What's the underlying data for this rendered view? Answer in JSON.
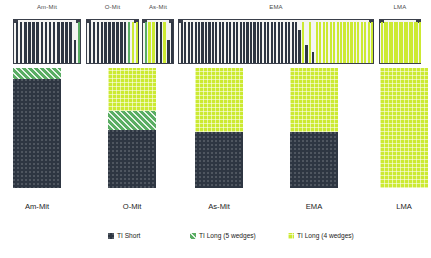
{
  "chart_data": {
    "type": "bar",
    "title": "",
    "xlabel": "",
    "ylabel": "",
    "categories": [
      "Am-Mit",
      "O-Mit",
      "As-Mit",
      "EMA",
      "LMA"
    ],
    "series": [
      {
        "name": "TI Short",
        "values": [
          93,
          55,
          45,
          45,
          0
        ]
      },
      {
        "name": "TI Long (5 wedges)",
        "values": [
          7,
          15,
          0,
          0,
          0
        ]
      },
      {
        "name": "TI Long (4 wedges)",
        "values": [
          0,
          30,
          55,
          55,
          100
        ]
      }
    ],
    "ylim": [
      0,
      100
    ],
    "grid": false,
    "legend_position": "bottom"
  },
  "top_panel": {
    "groups": [
      {
        "title": "Am-Mit",
        "bars": [
          {
            "type": "short",
            "height": 100
          },
          {
            "type": "short",
            "height": 100
          },
          {
            "type": "short",
            "height": 100
          },
          {
            "type": "short",
            "height": 100
          },
          {
            "type": "short",
            "height": 100
          },
          {
            "type": "short",
            "height": 100
          },
          {
            "type": "short",
            "height": 100
          },
          {
            "type": "short",
            "height": 100
          },
          {
            "type": "short",
            "height": 100
          },
          {
            "type": "short",
            "height": 100
          },
          {
            "type": "short",
            "height": 100
          },
          {
            "type": "short",
            "height": 100
          },
          {
            "type": "short",
            "height": 100
          },
          {
            "type": "short",
            "height": 100
          },
          {
            "type": "short",
            "height": 55
          },
          {
            "type": "long5",
            "height": 100
          }
        ]
      },
      {
        "title": "O-Mit",
        "bars": [
          {
            "type": "short",
            "height": 100
          },
          {
            "type": "short",
            "height": 100
          },
          {
            "type": "short",
            "height": 100
          },
          {
            "type": "short",
            "height": 100
          },
          {
            "type": "short",
            "height": 100
          },
          {
            "type": "short",
            "height": 100
          },
          {
            "type": "short",
            "height": 100
          },
          {
            "type": "short",
            "height": 100
          },
          {
            "type": "short",
            "height": 100
          },
          {
            "type": "short",
            "height": 100
          },
          {
            "type": "long5",
            "height": 100
          },
          {
            "type": "long4",
            "height": 100
          },
          {
            "type": "long4",
            "height": 100
          }
        ]
      },
      {
        "title": "As-Mit",
        "bars": [
          {
            "type": "long5",
            "height": 100
          },
          {
            "type": "long4",
            "height": 100
          },
          {
            "type": "long4",
            "height": 100
          },
          {
            "type": "short",
            "height": 100
          },
          {
            "type": "short",
            "height": 100
          },
          {
            "type": "long4",
            "height": 100
          },
          {
            "type": "short",
            "height": 55
          },
          {
            "type": "short",
            "height": 100
          }
        ]
      },
      {
        "title": "EMA",
        "bars": [
          {
            "type": "short",
            "height": 100
          },
          {
            "type": "short",
            "height": 100
          },
          {
            "type": "short",
            "height": 100
          },
          {
            "type": "short",
            "height": 100
          },
          {
            "type": "short",
            "height": 100
          },
          {
            "type": "short",
            "height": 100
          },
          {
            "type": "short",
            "height": 100
          },
          {
            "type": "short",
            "height": 100
          },
          {
            "type": "short",
            "height": 100
          },
          {
            "type": "short",
            "height": 100
          },
          {
            "type": "short",
            "height": 100
          },
          {
            "type": "short",
            "height": 100
          },
          {
            "type": "short",
            "height": 100
          },
          {
            "type": "short",
            "height": 100
          },
          {
            "type": "short",
            "height": 100
          },
          {
            "type": "short",
            "height": 100
          },
          {
            "type": "short",
            "height": 100
          },
          {
            "type": "short",
            "height": 100
          },
          {
            "type": "short",
            "height": 100
          },
          {
            "type": "short",
            "height": 100
          },
          {
            "type": "short",
            "height": 100
          },
          {
            "type": "short",
            "height": 100
          },
          {
            "type": "short",
            "height": 100
          },
          {
            "type": "short",
            "height": 100
          },
          {
            "type": "short",
            "height": 100
          },
          {
            "type": "short",
            "height": 100
          },
          {
            "type": "short",
            "height": 100
          },
          {
            "type": "short",
            "height": 100
          },
          {
            "type": "short",
            "height": 100
          },
          {
            "type": "short",
            "height": 100
          },
          {
            "type": "short",
            "height": 100
          },
          {
            "type": "short",
            "height": 100
          },
          {
            "type": "short",
            "height": 100
          },
          {
            "type": "short",
            "height": 100
          },
          {
            "type": "short",
            "height": 80
          },
          {
            "type": "long4",
            "height": 100
          },
          {
            "type": "short",
            "height": 45
          },
          {
            "type": "long4",
            "height": 100
          },
          {
            "type": "short",
            "height": 28
          },
          {
            "type": "long4",
            "height": 100
          },
          {
            "type": "long4",
            "height": 100
          },
          {
            "type": "long4",
            "height": 100
          },
          {
            "type": "long4",
            "height": 100
          },
          {
            "type": "long4",
            "height": 100
          },
          {
            "type": "long4",
            "height": 100
          },
          {
            "type": "long4",
            "height": 100
          },
          {
            "type": "long4",
            "height": 100
          },
          {
            "type": "long4",
            "height": 100
          },
          {
            "type": "long4",
            "height": 100
          },
          {
            "type": "long4",
            "height": 100
          },
          {
            "type": "long4",
            "height": 100
          },
          {
            "type": "long4",
            "height": 100
          },
          {
            "type": "long4",
            "height": 100
          },
          {
            "type": "long4",
            "height": 100
          },
          {
            "type": "long4",
            "height": 100
          },
          {
            "type": "long4",
            "height": 100
          }
        ]
      },
      {
        "title": "LMA",
        "bars": [
          {
            "type": "long4",
            "height": 100
          },
          {
            "type": "long4",
            "height": 100
          },
          {
            "type": "long4",
            "height": 100
          },
          {
            "type": "long4",
            "height": 100
          },
          {
            "type": "long4",
            "height": 100
          },
          {
            "type": "long4",
            "height": 100
          },
          {
            "type": "long4",
            "height": 100
          },
          {
            "type": "long4",
            "height": 100
          },
          {
            "type": "long4",
            "height": 100
          },
          {
            "type": "long4",
            "height": 100
          },
          {
            "type": "long4",
            "height": 100
          },
          {
            "type": "long4",
            "height": 100
          },
          {
            "type": "long4",
            "height": 100
          },
          {
            "type": "long4",
            "height": 100
          },
          {
            "type": "long4",
            "height": 100
          },
          {
            "type": "long4",
            "height": 100
          }
        ]
      }
    ]
  },
  "stacked_panel": {
    "bars": [
      {
        "label": "Am-Mit",
        "segments": [
          {
            "type": "long4",
            "pct": 0
          },
          {
            "type": "long5",
            "pct": 9
          },
          {
            "type": "short",
            "pct": 91
          }
        ]
      },
      {
        "label": "O-Mit",
        "segments": [
          {
            "type": "long4",
            "pct": 36
          },
          {
            "type": "long5",
            "pct": 16
          },
          {
            "type": "short",
            "pct": 48
          }
        ]
      },
      {
        "label": "As-Mit",
        "segments": [
          {
            "type": "long4",
            "pct": 53
          },
          {
            "type": "long5",
            "pct": 0
          },
          {
            "type": "short",
            "pct": 47
          }
        ]
      },
      {
        "label": "EMA",
        "segments": [
          {
            "type": "long4",
            "pct": 53
          },
          {
            "type": "long5",
            "pct": 0
          },
          {
            "type": "short",
            "pct": 47
          }
        ]
      },
      {
        "label": "LMA",
        "segments": [
          {
            "type": "long4",
            "pct": 100
          },
          {
            "type": "long5",
            "pct": 0
          },
          {
            "type": "short",
            "pct": 0
          }
        ]
      }
    ]
  },
  "legend": {
    "items": [
      {
        "label": "TI Short",
        "color": "#2e3642",
        "key": "short"
      },
      {
        "label": "TI Long (5 wedges)",
        "color": "#5aad63",
        "key": "long5"
      },
      {
        "label": "TI Long (4 wedges)",
        "color": "#ccea32",
        "key": "long4"
      }
    ]
  },
  "colors": {
    "ti_short": "#2e3642",
    "ti_long_5": "#5aad63",
    "ti_long_4": "#ccea32",
    "panel_border": "#3a3f4a",
    "panel_background": "#f4f4f2",
    "page_background": "#ffffff",
    "text": "#1b1b1b"
  }
}
